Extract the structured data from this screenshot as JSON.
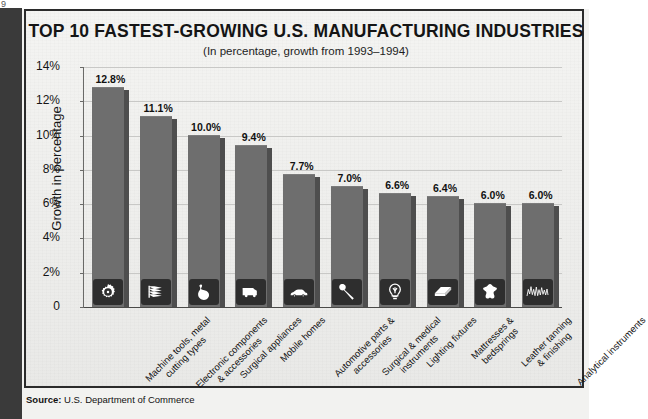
{
  "page": {
    "corner_mark": "9",
    "source_label": "Source:",
    "source_text": "U.S. Department of Commerce"
  },
  "chart_data": {
    "type": "bar",
    "title": "TOP 10 FASTEST-GROWING U.S. MANUFACTURING INDUSTRIES",
    "subtitle": "(In percentage, growth from 1993–1994)",
    "xlabel": "",
    "ylabel": "Growth in percentage",
    "ylim": [
      0,
      14
    ],
    "ytick_labels": [
      "14%",
      "12%",
      "10%",
      "8%",
      "6%",
      "4%",
      "2%",
      "0"
    ],
    "ytick_values": [
      14,
      12,
      10,
      8,
      6,
      4,
      2,
      0
    ],
    "grid": true,
    "legend": "none",
    "bar_color": "#6e6e6e",
    "bar_side_color": "#4e4e4e",
    "icon_panel_color": "#2e2e2e",
    "categories": [
      "Machine tools, metal cutting types",
      "Electronic components & accessories",
      "Surgical appliances",
      "Mobile homes",
      "Automotive parts & accessories",
      "Surgical & medical instruments",
      "Lighting fixtures",
      "Mattresses & bedsprings",
      "Leather tanning & finishing",
      "Analytical instruments"
    ],
    "category_lines": [
      [
        "Machine tools, metal",
        "cutting types"
      ],
      [
        "Electronic components",
        "& accessories"
      ],
      [
        "Surgical appliances"
      ],
      [
        "Mobile homes"
      ],
      [
        "Automotive parts &",
        "accessories"
      ],
      [
        "Surgical & medical",
        "instruments"
      ],
      [
        "Lighting fixtures"
      ],
      [
        "Mattresses &",
        "bedsprings"
      ],
      [
        "Leather tanning",
        "& finishing"
      ],
      [
        "Analytical instruments"
      ]
    ],
    "values": [
      12.8,
      11.1,
      10.0,
      9.4,
      7.7,
      7.0,
      6.6,
      6.4,
      6.0,
      6.0
    ],
    "value_labels": [
      "12.8%",
      "11.1%",
      "10.0%",
      "9.4%",
      "7.7%",
      "7.0%",
      "6.6%",
      "6.4%",
      "6.0%",
      "6.0%"
    ],
    "icons": [
      "gear-icon",
      "circuit-boards-icon",
      "surgical-glove-icon",
      "mobile-home-icon",
      "automobile-icon",
      "surgical-mallet-icon",
      "light-bulb-icon",
      "mattress-icon",
      "leather-hide-icon",
      "waveform-icon"
    ]
  }
}
